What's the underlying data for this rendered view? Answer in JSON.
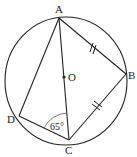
{
  "diagram": {
    "type": "geometry-circle-inscribed-quadrilateral",
    "circle": {
      "cx": 66,
      "cy": 81,
      "rx": 61,
      "ry": 64
    },
    "center": {
      "label": "O",
      "x": 64,
      "y": 77
    },
    "points": {
      "A": {
        "label": "A",
        "x": 59,
        "y": 18
      },
      "B": {
        "label": "B",
        "x": 126,
        "y": 74
      },
      "C": {
        "label": "C",
        "x": 69,
        "y": 140
      },
      "D": {
        "label": "D",
        "x": 19,
        "y": 116
      }
    },
    "segments": [
      "AB",
      "BC",
      "CD",
      "DA",
      "AC"
    ],
    "equal_marks": [
      "AB",
      "BC"
    ],
    "angle": {
      "vertex": "C",
      "value": "65°",
      "between": [
        "CD",
        "CA"
      ]
    }
  }
}
